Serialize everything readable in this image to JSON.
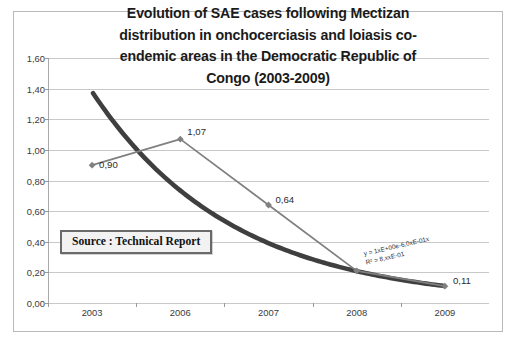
{
  "chart_data": {
    "type": "line",
    "title_lines": [
      "Evolution of SAE cases following Mectizan",
      "distribution in onchocerciasis and loiasis co-",
      "endemic areas in the Democratic Republic of",
      "Congo  (2003-2009)"
    ],
    "categories": [
      "2003",
      "2006",
      "2007",
      "2008",
      "2009"
    ],
    "xlabel": "",
    "ylabel": "",
    "ylim": [
      0.0,
      1.6
    ],
    "ytick_labels": [
      "0,00",
      "0,20",
      "0,40",
      "0,60",
      "0,80",
      "1,00",
      "1,20",
      "1,40",
      "1,60"
    ],
    "ytick_values": [
      0.0,
      0.2,
      0.4,
      0.6,
      0.8,
      1.0,
      1.2,
      1.4,
      1.6
    ],
    "grid": true,
    "legend": "none",
    "series": [
      {
        "name": "SAE cases",
        "marker": "diamond",
        "color": "#808080",
        "values": [
          0.9,
          1.07,
          0.64,
          0.21,
          0.11
        ],
        "data_labels": [
          "0,90",
          "1,07",
          "0,64",
          "",
          "0,11"
        ]
      },
      {
        "name": "Exponential trendline",
        "marker": "none",
        "color": "#3f3f3f",
        "values": [
          1.37,
          0.6,
          0.38,
          0.22,
          0.11
        ]
      }
    ],
    "annotations": [
      {
        "name": "source-note",
        "text": "Source : Technical Report"
      },
      {
        "name": "trendline-equation",
        "text": "y = 1xE+00e-6,0xE-01x"
      },
      {
        "name": "trendline-r2",
        "text": "R² = 8,xxE-01"
      }
    ],
    "colors": {
      "series_line": "#808080",
      "trendline": "#3f3f3f",
      "gridline": "#c8c8c8",
      "frame": "#b9b9b9",
      "text": "#1b1b1b",
      "source_box_border": "#6a6a6a",
      "source_box_fill": "#f2f2f2"
    }
  }
}
